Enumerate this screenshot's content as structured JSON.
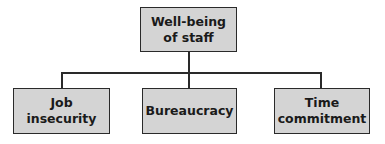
{
  "diagram": {
    "root": {
      "label": "Well-being\nof staff",
      "line1": "Well-being",
      "line2": "of staff"
    },
    "children": [
      {
        "label": "Job insecurity",
        "line1": "Job",
        "line2": "insecurity"
      },
      {
        "label": "Bureaucracy",
        "line1": "Bureaucracy"
      },
      {
        "label": "Time commitment",
        "line1": "Time",
        "line2": "commitment"
      }
    ],
    "colors": {
      "box_fill": "#d4d4d4",
      "border": "#2a2a2a",
      "text": "#1a1a1a"
    }
  }
}
